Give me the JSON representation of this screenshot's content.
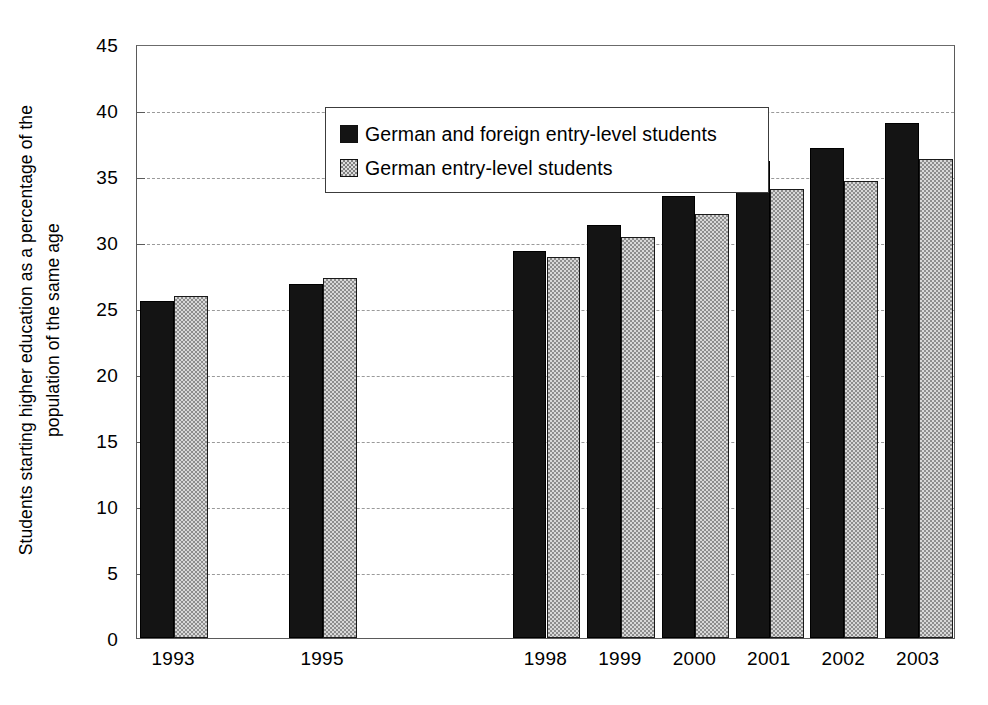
{
  "chart_data": {
    "type": "bar",
    "title": "",
    "xlabel": "",
    "ylabel_lines": [
      "Students starting higher education as a percentage of the",
      "population of the same age"
    ],
    "ylabel": "Students starting higher education as a percentage of the population of the same age",
    "categories": [
      "1993",
      "1994",
      "1995",
      "1996",
      "1997",
      "1998",
      "1999",
      "2000",
      "2001",
      "2002",
      "2003"
    ],
    "visible_categories": [
      "1993",
      "1995",
      "1998",
      "1999",
      "2000",
      "2001",
      "2002",
      "2003"
    ],
    "empty_categories": [
      "1994",
      "1996",
      "1997"
    ],
    "series": [
      {
        "name": "German and foreign entry-level students",
        "color": "#141414",
        "pattern": "solid",
        "values": [
          25.5,
          null,
          26.8,
          null,
          null,
          29.3,
          31.3,
          33.5,
          36.1,
          37.1,
          39.0
        ]
      },
      {
        "name": "German entry-level students",
        "color": "#d8d8d8",
        "pattern": "checkered",
        "values": [
          25.9,
          null,
          27.3,
          null,
          null,
          28.9,
          30.4,
          32.1,
          34.0,
          34.6,
          36.3
        ]
      }
    ],
    "ylim": [
      0,
      45
    ],
    "yticks": [
      0,
      5,
      10,
      15,
      20,
      25,
      30,
      35,
      40,
      45
    ],
    "ytick_labels": [
      "0",
      "5",
      "10",
      "15",
      "20",
      "25",
      "30",
      "35",
      "40",
      "45"
    ],
    "gridlines_at": [
      5,
      10,
      15,
      20,
      25,
      30,
      35,
      40
    ],
    "grid": "horizontal-dashed",
    "legend_position": "upper-left-inside"
  }
}
